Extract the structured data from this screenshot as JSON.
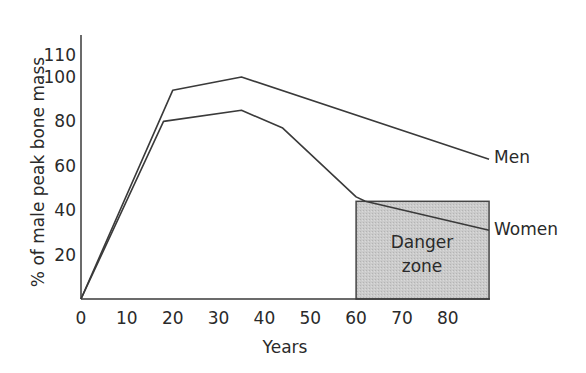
{
  "chart_data": {
    "type": "line",
    "title": "",
    "xlabel": "Years",
    "ylabel": "% of male peak bone mass",
    "xlim": [
      0,
      90
    ],
    "ylim": [
      0,
      110
    ],
    "x_ticks": [
      0,
      10,
      20,
      30,
      40,
      50,
      60,
      70,
      80
    ],
    "y_ticks": [
      20,
      40,
      60,
      80,
      100,
      110
    ],
    "grid": false,
    "legend": "inline labels at line ends",
    "series": [
      {
        "name": "Men",
        "x": [
          0,
          20,
          35,
          89
        ],
        "y": [
          0,
          94,
          100,
          63
        ]
      },
      {
        "name": "Women",
        "x": [
          0,
          18,
          35,
          44,
          60,
          62,
          89
        ],
        "y": [
          0,
          80,
          85,
          77,
          46,
          44,
          31
        ]
      }
    ],
    "annotations": [
      {
        "type": "shaded-region",
        "label": "Danger zone",
        "x_range": [
          60,
          89
        ],
        "y_range": [
          0,
          44
        ],
        "fill": "#c8c8c8"
      }
    ]
  },
  "labels": {
    "men": "Men",
    "women": "Women",
    "zone_line1": "Danger",
    "zone_line2": "zone",
    "xlabel": "Years",
    "ylabel": "% of male peak bone mass"
  },
  "colors": {
    "line": "#3a3a3a",
    "axis": "#3a3a3a",
    "zone_fill": "#c8c8c8",
    "zone_stroke": "#444444"
  }
}
